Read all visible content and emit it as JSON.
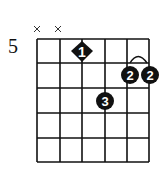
{
  "chord_diagram": {
    "base_fret_label": "5",
    "strings": 6,
    "frets": 5,
    "muted_strings": [
      1,
      2
    ],
    "muted_symbol": "×",
    "fingers": [
      {
        "string": 3,
        "fret": 1,
        "finger": "1",
        "shape": "diamond"
      },
      {
        "string": 5,
        "fret": 2,
        "finger": "2",
        "shape": "circle"
      },
      {
        "string": 6,
        "fret": 2,
        "finger": "2",
        "shape": "circle"
      },
      {
        "string": 4,
        "fret": 3,
        "finger": "3",
        "shape": "circle"
      }
    ],
    "barre": {
      "from_string": 5,
      "to_string": 6,
      "fret": 2
    }
  }
}
